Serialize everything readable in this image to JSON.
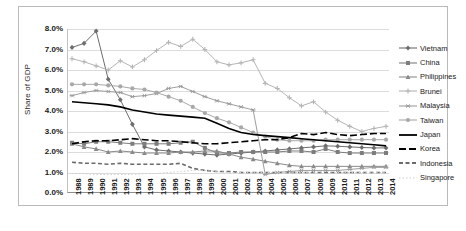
{
  "chart_data": {
    "type": "line",
    "title": "",
    "xlabel": "",
    "ylabel": "Share of GDP",
    "ylim": [
      0,
      8
    ],
    "ytick_labels": [
      "8.0%",
      "7.0%",
      "6.0%",
      "5.0%",
      "4.0%",
      "3.0%",
      "2.0%",
      "1.0%",
      "0.0%"
    ],
    "ytick_values": [
      8,
      7,
      6,
      5,
      4,
      3,
      2,
      1,
      0
    ],
    "grid": true,
    "legend_position": "right",
    "categories": [
      "1988",
      "1989",
      "1990",
      "1991",
      "1992",
      "1993",
      "1994",
      "1995",
      "1996",
      "1997",
      "1998",
      "1999",
      "2000",
      "2001",
      "2002",
      "2003",
      "2004",
      "2005",
      "2006",
      "2007",
      "2008",
      "2009",
      "2010",
      "2011",
      "2012",
      "2013",
      "2014"
    ],
    "series": [
      {
        "name": "Vietnam",
        "color": "#6e6e6e",
        "marker": "diamond",
        "dash": "none",
        "values": [
          7.1,
          7.3,
          7.9,
          5.55,
          4.55,
          3.35,
          2.25,
          2.1,
          2.05,
          2.0,
          1.95,
          1.9,
          1.85,
          1.9,
          1.95,
          2.0,
          2.05,
          2.1,
          2.15,
          2.2,
          2.25,
          2.3,
          2.28,
          2.25,
          2.22,
          2.2,
          2.2
        ]
      },
      {
        "name": "China",
        "color": "#7d7d7d",
        "marker": "square",
        "dash": "none",
        "values": [
          2.45,
          2.4,
          2.5,
          2.5,
          2.45,
          2.4,
          2.4,
          2.4,
          2.4,
          2.45,
          2.5,
          2.2,
          1.95,
          1.95,
          2.0,
          2.0,
          2.0,
          2.0,
          2.05,
          2.05,
          2.0,
          2.15,
          2.0,
          1.95,
          1.95,
          1.95,
          1.95
        ]
      },
      {
        "name": "Philippines",
        "color": "#8a8a8a",
        "marker": "triangle",
        "dash": "none",
        "values": [
          2.4,
          2.25,
          2.15,
          2.0,
          2.05,
          2.0,
          1.95,
          1.95,
          1.95,
          2.0,
          2.0,
          2.05,
          2.05,
          1.9,
          1.75,
          1.65,
          1.55,
          1.45,
          1.35,
          1.3,
          1.3,
          1.3,
          1.3,
          1.3,
          1.3,
          1.3,
          1.3
        ]
      },
      {
        "name": "Brunei",
        "color": "#b5b5b5",
        "marker": "cross",
        "dash": "none",
        "values": [
          6.55,
          6.4,
          6.2,
          6.0,
          6.45,
          6.15,
          6.5,
          6.95,
          7.35,
          7.15,
          7.5,
          7.0,
          6.4,
          6.25,
          6.35,
          6.5,
          5.35,
          5.1,
          4.65,
          4.25,
          4.45,
          3.95,
          3.55,
          3.25,
          3.0,
          3.15,
          3.25
        ]
      },
      {
        "name": "Malaysia",
        "color": "#9e9e9e",
        "marker": "star",
        "dash": "none",
        "values": [
          4.75,
          4.9,
          5.0,
          4.95,
          4.9,
          4.7,
          4.75,
          4.85,
          5.1,
          5.2,
          4.95,
          4.7,
          4.5,
          4.35,
          4.2,
          4.05,
          0.9,
          1.0,
          1.05,
          1.1,
          1.1,
          1.1,
          1.1,
          1.15,
          1.2,
          1.25,
          1.25
        ]
      },
      {
        "name": "Taiwan",
        "color": "#a8a8a8",
        "marker": "circle",
        "dash": "none",
        "values": [
          5.3,
          5.3,
          5.3,
          5.25,
          5.2,
          5.1,
          5.05,
          4.9,
          4.7,
          4.5,
          4.2,
          3.9,
          3.65,
          3.45,
          3.2,
          2.95,
          2.75,
          2.6,
          2.55,
          2.55,
          2.55,
          2.6,
          2.6,
          2.6,
          2.6,
          2.6,
          2.6
        ]
      },
      {
        "name": "Japan",
        "color": "#000000",
        "marker": "none",
        "dash": "none",
        "values": [
          4.45,
          4.4,
          4.35,
          4.3,
          4.2,
          4.05,
          3.95,
          3.85,
          3.8,
          3.75,
          3.7,
          3.65,
          3.4,
          3.15,
          2.95,
          2.85,
          2.8,
          2.75,
          2.7,
          2.65,
          2.6,
          2.55,
          2.5,
          2.45,
          2.4,
          2.35,
          2.3
        ]
      },
      {
        "name": "Korea",
        "color": "#000000",
        "marker": "none",
        "dash": "long",
        "values": [
          2.4,
          2.5,
          2.55,
          2.55,
          2.6,
          2.65,
          2.6,
          2.55,
          2.55,
          2.5,
          2.45,
          2.4,
          2.4,
          2.45,
          2.5,
          2.55,
          2.6,
          2.6,
          2.7,
          2.9,
          2.85,
          2.95,
          2.85,
          2.8,
          2.85,
          2.9,
          2.9
        ]
      },
      {
        "name": "Indonesia",
        "color": "#6b6b6b",
        "marker": "none",
        "dash": "short",
        "values": [
          1.5,
          1.45,
          1.45,
          1.4,
          1.45,
          1.4,
          1.4,
          1.4,
          1.4,
          1.45,
          1.2,
          1.1,
          1.05,
          1.05,
          1.0,
          1.0,
          1.0,
          1.0,
          1.0,
          1.0,
          1.0,
          1.0,
          1.0,
          1.0,
          1.0,
          1.0,
          1.0
        ]
      },
      {
        "name": "Singapore",
        "color": "#cfcfcf",
        "marker": "none",
        "dash": "dot",
        "values": [
          0.95,
          0.95,
          0.9,
          0.9,
          0.9,
          0.9,
          0.95,
          0.95,
          1.0,
          1.05,
          1.1,
          1.1,
          1.05,
          1.0,
          1.0,
          1.0,
          1.0,
          1.0,
          1.0,
          1.0,
          1.0,
          1.05,
          1.0,
          1.0,
          1.0,
          1.0,
          1.0
        ]
      }
    ]
  },
  "caption": ""
}
